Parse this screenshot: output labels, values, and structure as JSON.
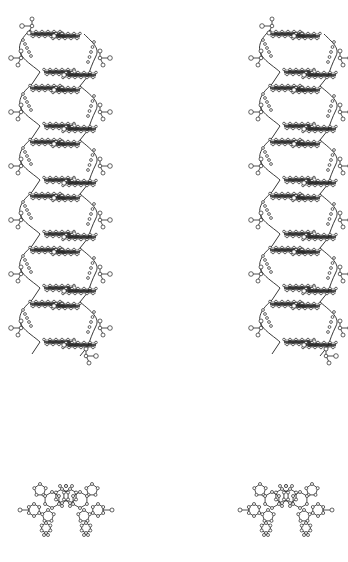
{
  "figure": {
    "description": "Stereo pair views of a double-helical molecular structure",
    "panels": [
      {
        "id": "side-view-left",
        "view": "side",
        "eye": "left",
        "x": 10,
        "y": 15,
        "base_pair_rows": 12
      },
      {
        "id": "side-view-right",
        "view": "side",
        "eye": "right",
        "x": 226,
        "y": 15,
        "base_pair_rows": 12
      },
      {
        "id": "top-view-left",
        "view": "top-down",
        "eye": "left",
        "x": 15,
        "y": 495
      },
      {
        "id": "top-view-right",
        "view": "top-down",
        "eye": "right",
        "x": 240,
        "y": 495
      }
    ],
    "colors": {
      "ink": "#222222",
      "atom_fill": "#ffffff",
      "background": "#ffffff"
    }
  }
}
